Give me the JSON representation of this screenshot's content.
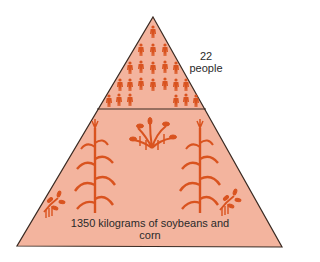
{
  "diagram": {
    "type": "food pyramid (trophic levels)",
    "colors": {
      "fill": "#f3b49e",
      "stroke": "#3a2a22",
      "icon": "#d9531f"
    },
    "levels": [
      {
        "name": "consumers",
        "count_label": "22",
        "unit_label": "people",
        "icon": "person-icon",
        "icon_count": 22
      },
      {
        "name": "producers",
        "label": "1350 kilograms of soybeans and corn",
        "icons": [
          "corn-plant-icon",
          "corn-plant-icon",
          "soybean-plant-icon",
          "soybean-plant-icon",
          "soybean-bush-icon"
        ]
      }
    ]
  }
}
